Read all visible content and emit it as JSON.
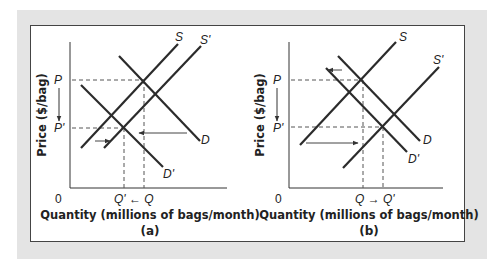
{
  "figure": {
    "colors": {
      "background_frame": "#e4e4e4",
      "panel": "#ffffff",
      "curve": "#2b2b2b",
      "dashed": "#555555",
      "arrow": "#444444"
    },
    "panels": [
      {
        "caption": "(a)",
        "y_axis_label": "Price ($/bag)",
        "x_axis_label": "Quantity (millions of bags/month)",
        "origin": "0",
        "price_labels": {
          "p": "P",
          "p_prime": "P'"
        },
        "quantity_labels": {
          "q": "Q",
          "q_prime": "Q'",
          "text": "Q' ← Q"
        },
        "curves": {
          "s": "S",
          "s_prime": "S'",
          "d": "D",
          "d_prime": "D'"
        },
        "shifts": [
          "supply shifts right (S to S')",
          "demand shifts left (D to D')"
        ]
      },
      {
        "caption": "(b)",
        "y_axis_label": "Price ($/bag)",
        "x_axis_label": "Quantity (millions of bags/month)",
        "origin": "0",
        "price_labels": {
          "p": "P",
          "p_prime": "P'"
        },
        "quantity_labels": {
          "q": "Q",
          "q_prime": "Q'",
          "text": "Q → Q'"
        },
        "curves": {
          "s": "S",
          "s_prime": "S'",
          "d": "D",
          "d_prime": "D'"
        },
        "shifts": [
          "supply shifts right (S to S')",
          "demand shifts left (D to D')"
        ]
      }
    ]
  }
}
